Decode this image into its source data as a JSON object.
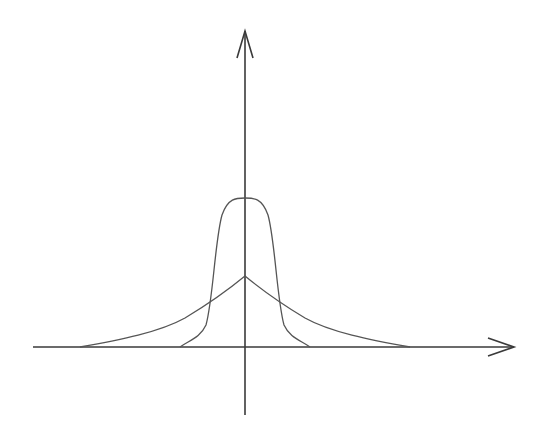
{
  "diagram": {
    "title": "",
    "type": "two bell-shaped curves on coordinate axes",
    "colors": {
      "background": "#ffffff",
      "axis": "#3a3a3a",
      "curve": "#555555"
    },
    "axes": {
      "origin": [
        245,
        347
      ],
      "x_axis": {
        "from": 33,
        "to": 515,
        "arrow": "right"
      },
      "y_axis": {
        "from": 415,
        "to": 30,
        "arrow": "up"
      }
    },
    "curves": [
      {
        "name": "narrow-tall-curve",
        "peak": [
          245,
          198
        ],
        "support": [
          180,
          310
        ],
        "description": "narrow, tall bell curve"
      },
      {
        "name": "wide-short-curve",
        "peak": [
          245,
          276
        ],
        "support": [
          80,
          410
        ],
        "description": "wide, short peaked curve with heavy tails"
      }
    ]
  }
}
